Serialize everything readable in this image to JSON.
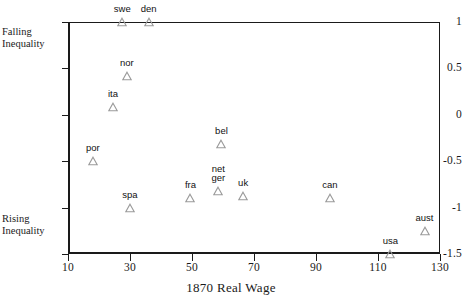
{
  "chart_data": {
    "type": "scatter",
    "title": "",
    "xlabel": "1870 Real Wage",
    "ylabel": "",
    "xlim": [
      10,
      130
    ],
    "ylim": [
      -1.5,
      1
    ],
    "grid": false,
    "legend": null,
    "xticks": [
      "10",
      "30",
      "50",
      "70",
      "90",
      "110",
      "130"
    ],
    "xtick_values": [
      10,
      30,
      50,
      70,
      90,
      110,
      130
    ],
    "yticks": [
      "1",
      "0.5",
      "0",
      "-0.5",
      "-1",
      "-1.5"
    ],
    "ytick_values": [
      1,
      0.5,
      0,
      -0.5,
      -1,
      -1.5
    ],
    "annotations": [
      {
        "text": "Falling Inequality",
        "line1": "Falling",
        "line2": "Inequality",
        "near_y": 1
      },
      {
        "text": "Rising Inequality",
        "line1": "Rising",
        "line2": "Inequality",
        "near_y": -1.15
      }
    ],
    "marker": "triangle-up-open",
    "points": [
      {
        "label": "swe",
        "x": 27.5,
        "y": 1.0
      },
      {
        "label": "den",
        "x": 36.0,
        "y": 1.0
      },
      {
        "label": "nor",
        "x": 29.0,
        "y": 0.42
      },
      {
        "label": "ita",
        "x": 24.5,
        "y": 0.08
      },
      {
        "label": "por",
        "x": 18.0,
        "y": -0.5
      },
      {
        "label": "bel",
        "x": 59.5,
        "y": -0.32
      },
      {
        "label": "net",
        "x": 58.0,
        "y": -0.8,
        "stacked_with": "ger"
      },
      {
        "label": "ger",
        "x": 58.5,
        "y": -0.82
      },
      {
        "label": "fra",
        "x": 49.5,
        "y": -0.9
      },
      {
        "label": "uk",
        "x": 66.5,
        "y": -0.88
      },
      {
        "label": "spa",
        "x": 30.0,
        "y": -1.0
      },
      {
        "label": "can",
        "x": 94.5,
        "y": -0.9
      },
      {
        "label": "aust",
        "x": 125.0,
        "y": -1.25
      },
      {
        "label": "usa",
        "x": 114.0,
        "y": -1.5
      }
    ]
  },
  "colors": {
    "axis": "#1a1a1a",
    "marker_stroke": "#9a9a9a",
    "label_text": "#111111",
    "background": "#ffffff"
  }
}
